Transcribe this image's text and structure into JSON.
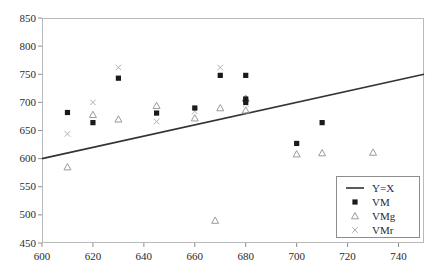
{
  "chart_data": {
    "type": "scatter",
    "title": "",
    "xlabel": "",
    "ylabel": "",
    "xlim": [
      600,
      750
    ],
    "ylim": [
      450,
      850
    ],
    "xticks": [
      600,
      620,
      640,
      660,
      680,
      700,
      720,
      740
    ],
    "yticks": [
      450,
      500,
      550,
      600,
      650,
      700,
      750,
      800,
      850
    ],
    "grid": false,
    "legend_position": "bottom-right",
    "reference_line": {
      "name": "Y=X",
      "x": [
        600,
        750
      ],
      "y": [
        600,
        750
      ]
    },
    "series": [
      {
        "name": "Y=X",
        "marker": "line",
        "color": "#333333",
        "x": [
          600,
          750
        ],
        "y": [
          600,
          750
        ]
      },
      {
        "name": "VM",
        "marker": "filled-square",
        "color": "#1a1a1a",
        "x": [
          610,
          620,
          630,
          645,
          660,
          670,
          680,
          680,
          680,
          700,
          710
        ],
        "y": [
          682,
          664,
          743,
          681,
          690,
          748,
          748,
          706,
          700,
          627,
          664
        ]
      },
      {
        "name": "VMg",
        "marker": "open-triangle",
        "color": "#9a9a9a",
        "x": [
          610,
          620,
          630,
          645,
          660,
          668,
          670,
          680,
          680,
          700,
          710,
          730
        ],
        "y": [
          585,
          678,
          670,
          694,
          672,
          490,
          690,
          707,
          686,
          608,
          610,
          611
        ]
      },
      {
        "name": "VMr",
        "marker": "x-cross",
        "color": "#b0b0b0",
        "x": [
          610,
          620,
          630,
          645,
          660,
          670,
          680
        ],
        "y": [
          644,
          700,
          762,
          666,
          684,
          762,
          697
        ]
      }
    ]
  },
  "legend": {
    "entries": [
      {
        "label": "Y=X",
        "marker": "line"
      },
      {
        "label": "VM",
        "marker": "filled-square"
      },
      {
        "label": "VMg",
        "marker": "open-triangle"
      },
      {
        "label": "VMr",
        "marker": "x-cross"
      }
    ]
  }
}
